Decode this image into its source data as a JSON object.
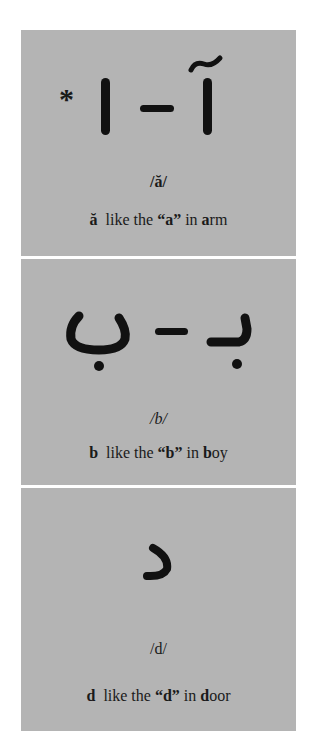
{
  "cards": [
    {
      "marker": "*",
      "forms": [
        "ا",
        "آ"
      ],
      "separator": "–",
      "phoneme": "/ă/",
      "letter": "ă",
      "like_prefix": "like the",
      "quoted": "“a”",
      "in_word": "in",
      "word_head": "a",
      "word_tail": "rm"
    },
    {
      "forms": [
        "ب",
        "بـ"
      ],
      "separator": "–",
      "phoneme": "/b/",
      "letter": "b",
      "like_prefix": "like the",
      "quoted": "“b”",
      "in_word": "in",
      "word_head": "b",
      "word_tail": "oy"
    },
    {
      "forms": [
        "د"
      ],
      "phoneme": "/d/",
      "letter": "d",
      "like_prefix": "like the",
      "quoted": "“d”",
      "in_word": "in",
      "word_head": "d",
      "word_tail": "oor"
    }
  ]
}
